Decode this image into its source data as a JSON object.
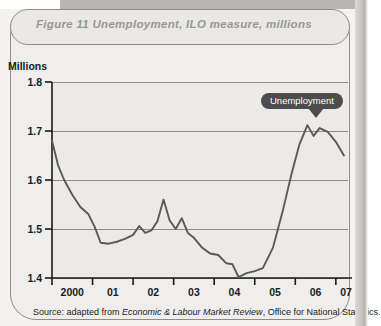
{
  "figure": {
    "title": "Figure 11  Unemployment, ILO measure, millions",
    "source_prefix": "Source: adapted from ",
    "source_italic": "Economic & Labour Market Review",
    "source_suffix": ", Office for National Statistics.",
    "callout_label": "Unemployment",
    "axis_unit_label": "Millions"
  },
  "chart_data": {
    "type": "line",
    "title": "Figure 11  Unemployment, ILO measure, millions",
    "xlabel": "",
    "ylabel": "Millions",
    "ylim": [
      1.4,
      1.8
    ],
    "xlim": [
      2000.0,
      2007.3
    ],
    "ytick_labels": [
      "1.8",
      "1.7",
      "1.6",
      "1.5",
      "1.4"
    ],
    "ytick_values": [
      1.8,
      1.7,
      1.6,
      1.5,
      1.4
    ],
    "xtick_labels": [
      "2000",
      "01",
      "02",
      "03",
      "04",
      "05",
      "06",
      "07"
    ],
    "xtick_values": [
      2000,
      2001,
      2002,
      2003,
      2004,
      2005,
      2006,
      2007
    ],
    "grid": "horizontal",
    "legend": "none",
    "annotations": [
      {
        "text": "Unemployment",
        "x": 2006.1,
        "y": 1.715,
        "style": "dark-rounded-callout-with-pointer"
      }
    ],
    "series": [
      {
        "name": "Unemployment (ILO measure, millions)",
        "color": "#595959",
        "x": [
          2000.0,
          2000.15,
          2000.3,
          2000.5,
          2000.7,
          2000.9,
          2001.05,
          2001.2,
          2001.4,
          2001.6,
          2001.8,
          2002.0,
          2002.15,
          2002.3,
          2002.45,
          2002.6,
          2002.75,
          2002.9,
          2003.05,
          2003.2,
          2003.35,
          2003.5,
          2003.7,
          2003.9,
          2004.1,
          2004.3,
          2004.45,
          2004.6,
          2004.8,
          2005.0,
          2005.2,
          2005.45,
          2005.7,
          2005.9,
          2006.1,
          2006.3,
          2006.45,
          2006.6,
          2006.8,
          2007.0,
          2007.2
        ],
        "y": [
          1.68,
          1.63,
          1.6,
          1.57,
          1.545,
          1.53,
          1.505,
          1.472,
          1.47,
          1.474,
          1.48,
          1.488,
          1.506,
          1.492,
          1.497,
          1.516,
          1.56,
          1.518,
          1.5,
          1.522,
          1.492,
          1.482,
          1.462,
          1.45,
          1.447,
          1.43,
          1.428,
          1.402,
          1.41,
          1.414,
          1.42,
          1.462,
          1.54,
          1.61,
          1.672,
          1.712,
          1.69,
          1.706,
          1.698,
          1.678,
          1.65
        ]
      }
    ]
  }
}
